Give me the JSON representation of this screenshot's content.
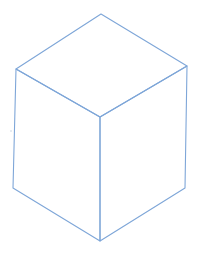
{
  "drawing": {
    "subject": "isometric cube line drawing",
    "colors": {
      "background": "#ffffff",
      "stroke": "#7ea6d8",
      "stray_mark": "#b9c9dc"
    },
    "stroke_width": 1.1,
    "vertices": {
      "top": [
        101,
        14
      ],
      "top_left": [
        16,
        69
      ],
      "top_right": [
        187,
        66
      ],
      "front_top": [
        100,
        117
      ],
      "bottom_left": [
        13,
        188
      ],
      "bottom_right": [
        185,
        188
      ],
      "bottom_front": [
        100,
        241
      ]
    },
    "faces": {
      "top": [
        "top",
        "top_right",
        "front_top",
        "top_left"
      ],
      "left": [
        "top_left",
        "front_top",
        "bottom_front",
        "bottom_left"
      ],
      "right": [
        "front_top",
        "top_right",
        "bottom_right",
        "bottom_front"
      ]
    },
    "stray_mark": [
      11,
      131
    ]
  }
}
